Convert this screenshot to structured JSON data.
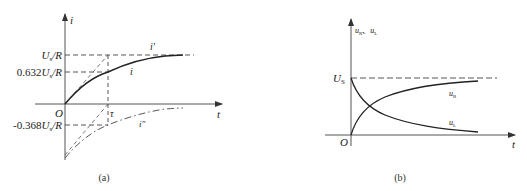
{
  "panel_a": {
    "caption": "(a)",
    "y_axis_label": "i",
    "x_axis_label": "t",
    "origin_label": "O",
    "tau_label": "τ",
    "y_ticks": [
      {
        "main": "U",
        "sub": "s",
        "rest": "/R",
        "value": "U_s/R"
      },
      {
        "prefix": "0.632",
        "main": "U",
        "sub": "s",
        "rest": "/R",
        "value": "0.632U_s/R"
      },
      {
        "prefix": "-0.368",
        "main": "U",
        "sub": "s",
        "rest": "/R",
        "value": "-0.368U_s/R"
      }
    ],
    "curves": [
      {
        "name": "i",
        "label": "i",
        "style": "solid"
      },
      {
        "name": "i_prime",
        "label": "i'",
        "style": "dashed"
      },
      {
        "name": "i_double_prime",
        "label": "i\"",
        "style": "dash-dot"
      }
    ]
  },
  "panel_b": {
    "caption": "(b)",
    "y_axis_label_main1": "u",
    "y_axis_label_sub1": "R",
    "y_axis_label_sep": "、",
    "y_axis_label_main2": "u",
    "y_axis_label_sub2": "L",
    "x_axis_label": "t",
    "origin_label": "O",
    "level_label_main": "U",
    "level_label_sub": "S",
    "curves": [
      {
        "name": "u_R",
        "main": "u",
        "sub": "R",
        "style": "solid"
      },
      {
        "name": "u_L",
        "main": "u",
        "sub": "L",
        "style": "solid"
      }
    ]
  }
}
